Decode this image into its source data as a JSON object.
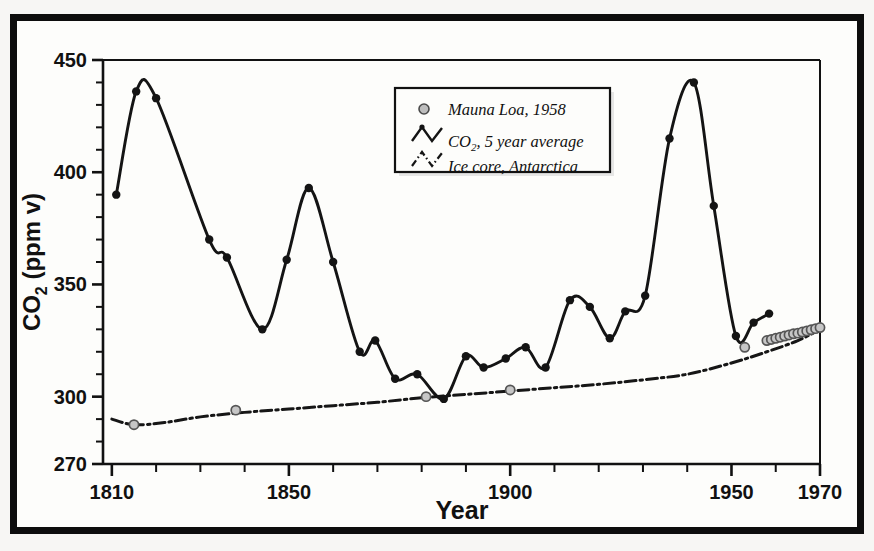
{
  "chart_data": {
    "type": "line",
    "title": "",
    "xlabel": "Year",
    "ylabel": "CO2 (ppm v)",
    "ylabel_main": "CO",
    "ylabel_sub": "2",
    "ylabel_unit": " (ppm v)",
    "xlim": [
      1808,
      1970
    ],
    "ylim": [
      270,
      450
    ],
    "xticks": [
      1810,
      1850,
      1900,
      1950,
      1970
    ],
    "xtick_labels": [
      "1810",
      "1850",
      "1900",
      "1950",
      "1970"
    ],
    "xminor_step": 10,
    "yticks": [
      270,
      300,
      350,
      400,
      450
    ],
    "ytick_labels": [
      "270",
      "300",
      "350",
      "400",
      "450"
    ],
    "yminor_step": 10,
    "grid": false,
    "legend_position": "upper-center",
    "series": [
      {
        "name": "CO2, 5 year average",
        "style": "solid-line-with-filled-circles",
        "color": "#141414",
        "points": [
          [
            1811,
            390
          ],
          [
            1815.5,
            436
          ],
          [
            1820,
            433
          ],
          [
            1832,
            370
          ],
          [
            1836,
            362
          ],
          [
            1844,
            330
          ],
          [
            1849.5,
            361
          ],
          [
            1854.5,
            393
          ],
          [
            1860,
            360
          ],
          [
            1866,
            320
          ],
          [
            1869.5,
            325
          ],
          [
            1874,
            308
          ],
          [
            1879,
            310
          ],
          [
            1885,
            299
          ],
          [
            1890,
            318
          ],
          [
            1894,
            313
          ],
          [
            1899,
            317
          ],
          [
            1903.5,
            322
          ],
          [
            1908,
            313
          ],
          [
            1913.5,
            343
          ],
          [
            1918,
            340
          ],
          [
            1922.5,
            326
          ],
          [
            1926,
            338
          ],
          [
            1930.5,
            345
          ],
          [
            1936,
            415
          ],
          [
            1941.5,
            440
          ],
          [
            1946,
            385
          ],
          [
            1951,
            327
          ],
          [
            1955,
            333
          ],
          [
            1958.5,
            337
          ]
        ]
      },
      {
        "name": "Ice core, Antarctica",
        "style": "dash-dot-line",
        "color": "#161616",
        "points": [
          [
            1810,
            290
          ],
          [
            1815,
            287.5
          ],
          [
            1822,
            288.5
          ],
          [
            1830,
            291
          ],
          [
            1840,
            293
          ],
          [
            1850,
            294.5
          ],
          [
            1860,
            296
          ],
          [
            1870,
            297.5
          ],
          [
            1880,
            299.5
          ],
          [
            1890,
            301
          ],
          [
            1900,
            302.5
          ],
          [
            1910,
            304
          ],
          [
            1920,
            305.5
          ],
          [
            1930,
            307.5
          ],
          [
            1940,
            310
          ],
          [
            1950,
            315
          ],
          [
            1958,
            320
          ],
          [
            1965,
            325
          ],
          [
            1970,
            330
          ]
        ]
      },
      {
        "name": "Mauna Loa, 1958",
        "style": "open-gray-circles",
        "color": "#9a9a9a",
        "points": [
          [
            1815,
            287.5
          ],
          [
            1838,
            294
          ],
          [
            1881,
            300
          ],
          [
            1900,
            303
          ],
          [
            1953,
            322
          ],
          [
            1958,
            325
          ],
          [
            1959,
            325.5
          ],
          [
            1960,
            326
          ],
          [
            1961,
            326.5
          ],
          [
            1962,
            327
          ],
          [
            1963,
            327.5
          ],
          [
            1964,
            328
          ],
          [
            1965,
            328.3
          ],
          [
            1966,
            328.8
          ],
          [
            1967,
            329.3
          ],
          [
            1968,
            329.8
          ],
          [
            1969,
            330.3
          ],
          [
            1970,
            330.8
          ]
        ]
      }
    ],
    "legend": [
      {
        "label": "Mauna Loa, 1958",
        "marker": "open-circle"
      },
      {
        "label": "CO2, 5 year average",
        "label_pre": "CO",
        "label_sub": "2",
        "label_post": ", 5 year average",
        "marker": "solid-zigzag"
      },
      {
        "label": "Ice core, Antarctica",
        "marker": "dashed-zigzag"
      }
    ]
  }
}
